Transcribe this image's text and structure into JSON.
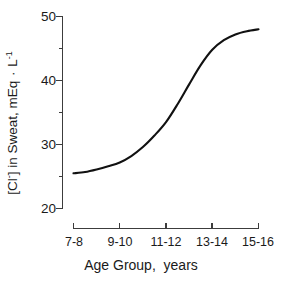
{
  "chart_data": {
    "type": "line",
    "title": "",
    "xlabel": "Age Group,  years",
    "ylabel_parts": {
      "prefix": "[Cl",
      "charge": "-",
      "middle": "] in Sweat, mEq ",
      "dot": "·",
      "unit": " L",
      "exponent": "-1"
    },
    "ylabel_plain": "[Cl-] in Sweat, mEq · L-1",
    "categories": [
      "7-8",
      "9-10",
      "11-12",
      "13-14",
      "15-16"
    ],
    "values": [
      25.5,
      27.2,
      33.5,
      44.8,
      48.0
    ],
    "series": [
      {
        "name": "Sweat chloride concentration",
        "values": [
          25.5,
          27.2,
          33.5,
          44.8,
          48.0
        ]
      }
    ],
    "x_tick_labels": [
      "7-8",
      "9-10",
      "11-12",
      "13-14",
      "15-16"
    ],
    "y_tick_labels": [
      "20",
      "30",
      "40",
      "50"
    ],
    "y_major_ticks": [
      20,
      30,
      40,
      50
    ],
    "y_minor_ticks": [
      25,
      35,
      45
    ],
    "ylim": [
      20,
      50
    ],
    "xlim": [
      0,
      4
    ],
    "grid": false,
    "legend": false,
    "legend_position": "none",
    "line_color": "#111111",
    "axis_color": "#3c3c3c",
    "background_color": "#ffffff",
    "curve_points": [
      {
        "x": 0.0,
        "y": 25.5
      },
      {
        "x": 0.25,
        "y": 25.7
      },
      {
        "x": 0.5,
        "y": 26.1
      },
      {
        "x": 0.75,
        "y": 26.6
      },
      {
        "x": 1.0,
        "y": 27.2
      },
      {
        "x": 1.25,
        "y": 28.2
      },
      {
        "x": 1.5,
        "y": 29.6
      },
      {
        "x": 1.75,
        "y": 31.4
      },
      {
        "x": 2.0,
        "y": 33.5
      },
      {
        "x": 2.25,
        "y": 36.3
      },
      {
        "x": 2.5,
        "y": 39.4
      },
      {
        "x": 2.75,
        "y": 42.4
      },
      {
        "x": 3.0,
        "y": 44.8
      },
      {
        "x": 3.25,
        "y": 46.3
      },
      {
        "x": 3.5,
        "y": 47.2
      },
      {
        "x": 3.75,
        "y": 47.7
      },
      {
        "x": 4.0,
        "y": 48.0
      }
    ],
    "annotations": []
  },
  "axes": {
    "y_ticks": [
      {
        "label": "50"
      },
      {
        "label": "40"
      },
      {
        "label": "30"
      },
      {
        "label": "20"
      }
    ],
    "x_ticks": [
      {
        "label": "7-8"
      },
      {
        "label": "9-10"
      },
      {
        "label": "11-12"
      },
      {
        "label": "13-14"
      },
      {
        "label": "15-16"
      }
    ]
  }
}
